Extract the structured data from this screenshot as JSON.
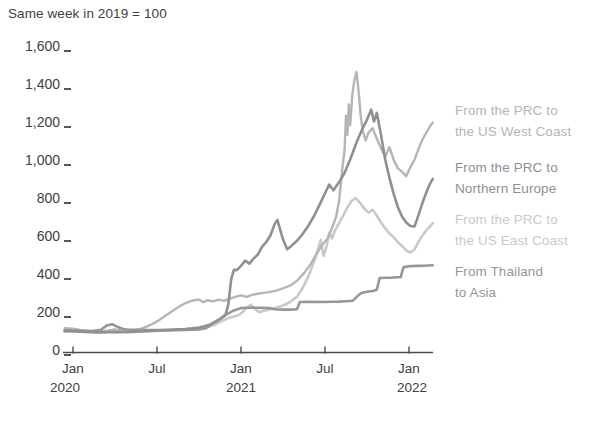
{
  "title": "Same week in 2019 = 100",
  "colors": {
    "background": "#ffffff",
    "axis_text": "#3e3f41",
    "axis_line": "#4a4c4e",
    "series_west_coast": "#b3b5b8",
    "series_northern_europe": "#8e9093",
    "series_east_coast": "#c7c9cc",
    "series_thailand_asia": "#95979a"
  },
  "chart_data": {
    "type": "line",
    "title": "Same week in 2019 = 100",
    "grid": "off",
    "legend_position": "right-of-plot, stacked beside line endpoints",
    "x_axis": {
      "unit": "months_since_2020-01",
      "range": [
        -0.6,
        25.7
      ],
      "tick_months": [
        0,
        6,
        12,
        18,
        24
      ],
      "tick_labels": [
        "Jan",
        "Jul",
        "Jan",
        "Jul",
        "Jan"
      ],
      "year_labels": [
        "2020",
        "2021",
        "2022"
      ]
    },
    "y_axis": {
      "range": [
        0,
        1600
      ],
      "tick_values": [
        1600,
        1400,
        1200,
        1000,
        800,
        600,
        400,
        200,
        0
      ],
      "tick_labels": [
        "1,600",
        "1,400",
        "1,200",
        "1,000",
        "800",
        "600",
        "400",
        "200",
        "0"
      ]
    },
    "series": [
      {
        "name": "From the PRC to the US West Coast",
        "legend_lines": [
          "From the PRC to",
          "the US West Coast"
        ],
        "color": "#b3b5b8",
        "points": [
          [
            -0.6,
            112
          ],
          [
            0,
            110
          ],
          [
            0.5,
            103
          ],
          [
            1,
            99
          ],
          [
            1.5,
            96
          ],
          [
            2,
            95
          ],
          [
            2.5,
            100
          ],
          [
            3,
            106
          ],
          [
            3.5,
            100
          ],
          [
            4,
            99
          ],
          [
            4.5,
            103
          ],
          [
            5,
            112
          ],
          [
            5.5,
            128
          ],
          [
            6,
            148
          ],
          [
            6.5,
            172
          ],
          [
            7,
            198
          ],
          [
            7.5,
            222
          ],
          [
            8,
            243
          ],
          [
            8.5,
            257
          ],
          [
            9,
            263
          ],
          [
            9.3,
            249
          ],
          [
            9.6,
            259
          ],
          [
            10,
            253
          ],
          [
            10.4,
            262
          ],
          [
            10.8,
            256
          ],
          [
            11.2,
            268
          ],
          [
            11.6,
            277
          ],
          [
            12,
            285
          ],
          [
            12.4,
            277
          ],
          [
            12.8,
            288
          ],
          [
            13.2,
            293
          ],
          [
            13.6,
            298
          ],
          [
            14,
            302
          ],
          [
            14.5,
            310
          ],
          [
            15,
            322
          ],
          [
            15.5,
            336
          ],
          [
            16,
            362
          ],
          [
            16.5,
            402
          ],
          [
            17,
            452
          ],
          [
            17.4,
            505
          ],
          [
            17.8,
            550
          ],
          [
            18.2,
            585
          ],
          [
            18.5,
            640
          ],
          [
            18.8,
            700
          ],
          [
            19,
            780
          ],
          [
            19.1,
            850
          ],
          [
            19.25,
            960
          ],
          [
            19.4,
            1050
          ],
          [
            19.5,
            1230
          ],
          [
            19.6,
            1130
          ],
          [
            19.7,
            1290
          ],
          [
            19.8,
            1180
          ],
          [
            19.95,
            1340
          ],
          [
            20.1,
            1420
          ],
          [
            20.25,
            1460
          ],
          [
            20.4,
            1360
          ],
          [
            20.55,
            1230
          ],
          [
            20.7,
            1150
          ],
          [
            20.9,
            1100
          ],
          [
            21.1,
            1140
          ],
          [
            21.4,
            1165
          ],
          [
            21.7,
            1110
          ],
          [
            22,
            1060
          ],
          [
            22.3,
            1015
          ],
          [
            22.6,
            1065
          ],
          [
            22.9,
            1000
          ],
          [
            23.2,
            955
          ],
          [
            23.5,
            935
          ],
          [
            23.8,
            912
          ],
          [
            24.1,
            960
          ],
          [
            24.4,
            1000
          ],
          [
            24.7,
            1060
          ],
          [
            25,
            1110
          ],
          [
            25.3,
            1150
          ],
          [
            25.5,
            1175
          ],
          [
            25.7,
            1195
          ]
        ]
      },
      {
        "name": "From the PRC to Northern Europe",
        "legend_lines": [
          "From the PRC to",
          "Northern Europe"
        ],
        "color": "#8e9093",
        "points": [
          [
            -0.6,
            97
          ],
          [
            0,
            96
          ],
          [
            0.5,
            94
          ],
          [
            1,
            93
          ],
          [
            1.5,
            91
          ],
          [
            2,
            90
          ],
          [
            2.5,
            91
          ],
          [
            3,
            92
          ],
          [
            3.5,
            91
          ],
          [
            4,
            92
          ],
          [
            4.5,
            94
          ],
          [
            5,
            96
          ],
          [
            5.5,
            98
          ],
          [
            6,
            100
          ],
          [
            6.5,
            102
          ],
          [
            7,
            104
          ],
          [
            7.5,
            106
          ],
          [
            8,
            108
          ],
          [
            8.5,
            111
          ],
          [
            9,
            115
          ],
          [
            9.4,
            122
          ],
          [
            9.8,
            132
          ],
          [
            10.2,
            148
          ],
          [
            10.6,
            165
          ],
          [
            10.9,
            185
          ],
          [
            11.1,
            240
          ],
          [
            11.3,
            370
          ],
          [
            11.5,
            420
          ],
          [
            11.7,
            418
          ],
          [
            12,
            440
          ],
          [
            12.3,
            468
          ],
          [
            12.6,
            452
          ],
          [
            12.9,
            478
          ],
          [
            13.2,
            500
          ],
          [
            13.5,
            540
          ],
          [
            13.8,
            565
          ],
          [
            14.1,
            600
          ],
          [
            14.4,
            660
          ],
          [
            14.6,
            682
          ],
          [
            14.8,
            630
          ],
          [
            15,
            580
          ],
          [
            15.3,
            528
          ],
          [
            15.6,
            545
          ],
          [
            16,
            572
          ],
          [
            16.4,
            608
          ],
          [
            16.8,
            650
          ],
          [
            17.2,
            700
          ],
          [
            17.6,
            760
          ],
          [
            18,
            822
          ],
          [
            18.3,
            868
          ],
          [
            18.6,
            838
          ],
          [
            19,
            880
          ],
          [
            19.4,
            930
          ],
          [
            19.8,
            1000
          ],
          [
            20.2,
            1080
          ],
          [
            20.6,
            1150
          ],
          [
            21,
            1210
          ],
          [
            21.3,
            1262
          ],
          [
            21.5,
            1200
          ],
          [
            21.7,
            1245
          ],
          [
            22,
            1130
          ],
          [
            22.3,
            1000
          ],
          [
            22.6,
            905
          ],
          [
            22.9,
            820
          ],
          [
            23.2,
            750
          ],
          [
            23.5,
            700
          ],
          [
            23.8,
            668
          ],
          [
            24.1,
            650
          ],
          [
            24.4,
            648
          ],
          [
            24.7,
            712
          ],
          [
            25,
            780
          ],
          [
            25.3,
            838
          ],
          [
            25.5,
            872
          ],
          [
            25.7,
            898
          ]
        ]
      },
      {
        "name": "From the PRC to the US East Coast",
        "legend_lines": [
          "From the PRC to",
          "the US East Coast"
        ],
        "color": "#c7c9cc",
        "points": [
          [
            -0.6,
            96
          ],
          [
            0,
            95
          ],
          [
            0.5,
            93
          ],
          [
            1,
            91
          ],
          [
            1.5,
            90
          ],
          [
            2,
            90
          ],
          [
            2.5,
            93
          ],
          [
            3,
            96
          ],
          [
            3.5,
            93
          ],
          [
            4,
            92
          ],
          [
            4.5,
            94
          ],
          [
            5,
            95
          ],
          [
            5.5,
            97
          ],
          [
            6,
            98
          ],
          [
            6.5,
            100
          ],
          [
            7,
            101
          ],
          [
            7.5,
            102
          ],
          [
            8,
            104
          ],
          [
            8.5,
            106
          ],
          [
            9,
            109
          ],
          [
            9.4,
            114
          ],
          [
            9.8,
            122
          ],
          [
            10.2,
            133
          ],
          [
            10.6,
            148
          ],
          [
            11,
            162
          ],
          [
            11.4,
            172
          ],
          [
            11.8,
            180
          ],
          [
            12.1,
            196
          ],
          [
            12.4,
            220
          ],
          [
            12.7,
            236
          ],
          [
            13,
            214
          ],
          [
            13.3,
            196
          ],
          [
            13.6,
            202
          ],
          [
            14,
            210
          ],
          [
            14.4,
            218
          ],
          [
            14.8,
            226
          ],
          [
            15.2,
            238
          ],
          [
            15.6,
            255
          ],
          [
            16,
            278
          ],
          [
            16.3,
            310
          ],
          [
            16.6,
            352
          ],
          [
            16.9,
            400
          ],
          [
            17.1,
            442
          ],
          [
            17.3,
            478
          ],
          [
            17.5,
            528
          ],
          [
            17.7,
            577
          ],
          [
            17.9,
            492
          ],
          [
            18.1,
            540
          ],
          [
            18.3,
            614
          ],
          [
            18.5,
            585
          ],
          [
            18.7,
            625
          ],
          [
            19,
            665
          ],
          [
            19.3,
            705
          ],
          [
            19.6,
            748
          ],
          [
            19.9,
            782
          ],
          [
            20.2,
            797
          ],
          [
            20.5,
            772
          ],
          [
            20.8,
            742
          ],
          [
            21.1,
            720
          ],
          [
            21.4,
            736
          ],
          [
            21.7,
            705
          ],
          [
            22,
            668
          ],
          [
            22.3,
            638
          ],
          [
            22.6,
            610
          ],
          [
            22.9,
            592
          ],
          [
            23.2,
            565
          ],
          [
            23.5,
            545
          ],
          [
            23.8,
            522
          ],
          [
            24.1,
            510
          ],
          [
            24.4,
            528
          ],
          [
            24.7,
            570
          ],
          [
            25,
            605
          ],
          [
            25.3,
            632
          ],
          [
            25.5,
            648
          ],
          [
            25.7,
            665
          ]
        ]
      },
      {
        "name": "From Thailand to Asia",
        "legend_lines": [
          "From Thailand",
          "to Asia"
        ],
        "color": "#95979a",
        "points": [
          [
            -0.6,
            101
          ],
          [
            0,
            100
          ],
          [
            0.5,
            98
          ],
          [
            1,
            97
          ],
          [
            1.5,
            99
          ],
          [
            2,
            104
          ],
          [
            2.4,
            126
          ],
          [
            2.8,
            133
          ],
          [
            3.2,
            118
          ],
          [
            3.6,
            108
          ],
          [
            4,
            104
          ],
          [
            4.5,
            103
          ],
          [
            5,
            102
          ],
          [
            5.5,
            102
          ],
          [
            6,
            102
          ],
          [
            6.5,
            102
          ],
          [
            7,
            102
          ],
          [
            7.5,
            103
          ],
          [
            8,
            103
          ],
          [
            8.5,
            104
          ],
          [
            9,
            106
          ],
          [
            9.5,
            112
          ],
          [
            10,
            138
          ],
          [
            10.5,
            160
          ],
          [
            11,
            186
          ],
          [
            11.5,
            206
          ],
          [
            12,
            218
          ],
          [
            12.5,
            220
          ],
          [
            13,
            220
          ],
          [
            13.5,
            219
          ],
          [
            14,
            218
          ],
          [
            14.4,
            212
          ],
          [
            15,
            210
          ],
          [
            15.5,
            210
          ],
          [
            16,
            212
          ],
          [
            16.2,
            250
          ],
          [
            17,
            251
          ],
          [
            18,
            250
          ],
          [
            18.5,
            251
          ],
          [
            19,
            252
          ],
          [
            19.5,
            254
          ],
          [
            20,
            257
          ],
          [
            20.3,
            280
          ],
          [
            20.6,
            298
          ],
          [
            21,
            304
          ],
          [
            21.4,
            308
          ],
          [
            21.7,
            314
          ],
          [
            21.9,
            376
          ],
          [
            22.3,
            378
          ],
          [
            22.7,
            378
          ],
          [
            23.1,
            380
          ],
          [
            23.4,
            380
          ],
          [
            23.6,
            432
          ],
          [
            24,
            438
          ],
          [
            24.5,
            440
          ],
          [
            25,
            441
          ],
          [
            25.7,
            443
          ]
        ]
      }
    ]
  }
}
